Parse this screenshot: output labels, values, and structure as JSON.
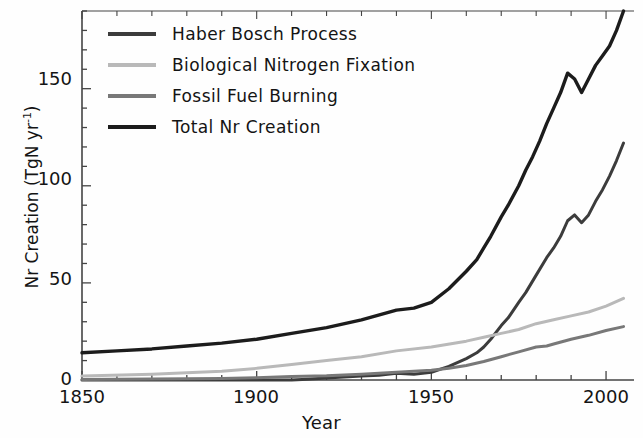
{
  "chart_data": {
    "type": "line",
    "title": "",
    "xlabel": "Year",
    "ylabel": "Nr Creation (TgN yr-1)",
    "ylabel_main": "Nr Creation (TgN yr",
    "ylabel_sup": "-1",
    "ylabel_close": ")",
    "xlim": [
      1850,
      2008
    ],
    "ylim": [
      0,
      190
    ],
    "xticks": [
      1850,
      1900,
      1950,
      2000
    ],
    "xtick_labels": [
      "1850",
      "1900",
      "1950",
      "2000"
    ],
    "yticks": [
      0,
      50,
      100,
      150
    ],
    "ytick_labels": [
      "0",
      "50",
      "100",
      "150"
    ],
    "x_minor_tick_step": 10,
    "y_minor_tick_step": 10,
    "grid": false,
    "legend_position": "upper left",
    "series": [
      {
        "name": "Haber Bosch Process",
        "color": "#3c3c3c",
        "width": 3.0,
        "x": [
          1850,
          1860,
          1870,
          1880,
          1890,
          1900,
          1910,
          1913,
          1920,
          1925,
          1930,
          1935,
          1940,
          1945,
          1950,
          1955,
          1960,
          1963,
          1965,
          1967,
          1970,
          1972,
          1975,
          1977,
          1980,
          1983,
          1985,
          1987,
          1989,
          1991,
          1993,
          1995,
          1997,
          1999,
          2001,
          2003,
          2005
        ],
        "values": [
          0,
          0,
          0,
          0,
          0,
          0,
          0,
          0.3,
          1,
          1.5,
          2,
          2.5,
          3.5,
          3,
          4,
          7,
          11,
          14,
          17,
          21,
          28,
          32,
          40,
          45,
          54,
          63,
          68,
          74,
          82,
          85,
          81,
          85,
          92,
          98,
          105,
          113,
          122
        ]
      },
      {
        "name": "Biological Nitrogen Fixation",
        "color": "#b9b9b9",
        "width": 3.0,
        "x": [
          1850,
          1870,
          1890,
          1900,
          1910,
          1920,
          1930,
          1940,
          1950,
          1960,
          1965,
          1970,
          1975,
          1980,
          1985,
          1990,
          1995,
          2000,
          2005
        ],
        "values": [
          2,
          3,
          4.5,
          6,
          8,
          10,
          12,
          15,
          17,
          20,
          22,
          24,
          26,
          29,
          31,
          33,
          35,
          38,
          42
        ]
      },
      {
        "name": "Fossil Fuel Burning",
        "color": "#787878",
        "width": 3.0,
        "x": [
          1850,
          1870,
          1890,
          1900,
          1910,
          1920,
          1930,
          1940,
          1950,
          1955,
          1960,
          1965,
          1970,
          1975,
          1980,
          1983,
          1985,
          1990,
          1995,
          2000,
          2005
        ],
        "values": [
          0.3,
          0.5,
          0.8,
          1.2,
          1.8,
          2.2,
          3,
          4,
          5,
          6,
          7.5,
          9.5,
          12,
          14.5,
          17,
          17.5,
          18.5,
          21,
          23,
          25.5,
          27.5
        ]
      },
      {
        "name": "Total Nr Creation",
        "color": "#1c1c1c",
        "width": 3.4,
        "x": [
          1850,
          1860,
          1870,
          1880,
          1890,
          1900,
          1910,
          1920,
          1930,
          1940,
          1945,
          1950,
          1955,
          1960,
          1963,
          1965,
          1967,
          1970,
          1972,
          1975,
          1977,
          1979,
          1981,
          1983,
          1985,
          1987,
          1989,
          1991,
          1993,
          1995,
          1997,
          1999,
          2001,
          2003,
          2005
        ],
        "values": [
          14,
          15,
          16,
          17.5,
          19,
          21,
          24,
          27,
          31,
          36,
          37,
          40,
          47,
          56,
          62,
          68,
          74,
          84,
          90,
          100,
          108,
          115,
          123,
          132,
          140,
          148,
          158,
          155,
          148,
          155,
          162,
          167,
          172,
          180,
          190
        ]
      }
    ]
  },
  "legend": {
    "entries": [
      {
        "label": "Haber Bosch Process",
        "color": "#3c3c3c"
      },
      {
        "label": "Biological Nitrogen Fixation",
        "color": "#b9b9b9"
      },
      {
        "label": "Fossil Fuel Burning",
        "color": "#787878"
      },
      {
        "label": "Total Nr Creation",
        "color": "#1c1c1c"
      }
    ]
  },
  "axes": {
    "x_title": "Year",
    "ytick_0": "0",
    "ytick_1": "50",
    "ytick_2": "100",
    "ytick_3": "150",
    "xtick_0": "1850",
    "xtick_1": "1900",
    "xtick_2": "1950",
    "xtick_3": "2000"
  }
}
